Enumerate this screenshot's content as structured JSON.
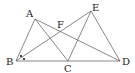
{
  "diagram": {
    "type": "geometry-figure",
    "points": {
      "A": {
        "x": 35,
        "y": 19,
        "label": "A",
        "lx": 26,
        "ly": 17
      },
      "B": {
        "x": 16,
        "y": 61,
        "label": "B",
        "lx": 6,
        "ly": 65
      },
      "C": {
        "x": 68,
        "y": 61,
        "label": "C",
        "lx": 64,
        "ly": 72
      },
      "D": {
        "x": 120,
        "y": 61,
        "label": "D",
        "lx": 122,
        "ly": 65
      },
      "E": {
        "x": 91,
        "y": 11,
        "label": "E",
        "lx": 92,
        "ly": 11
      },
      "F": {
        "x": 59,
        "y": 31,
        "label": "F",
        "lx": 57,
        "ly": 28
      }
    },
    "segments": [
      [
        "A",
        "B"
      ],
      [
        "A",
        "C"
      ],
      [
        "A",
        "D"
      ],
      [
        "B",
        "E"
      ],
      [
        "B",
        "D"
      ],
      [
        "C",
        "E"
      ],
      [
        "E",
        "D"
      ]
    ],
    "angle_marks": [
      {
        "at": "B",
        "marks": [
          "dot-upper",
          "dot-lower"
        ]
      }
    ],
    "colors": {
      "line": "#555555",
      "text": "#222222",
      "background": "#ffffff"
    }
  }
}
